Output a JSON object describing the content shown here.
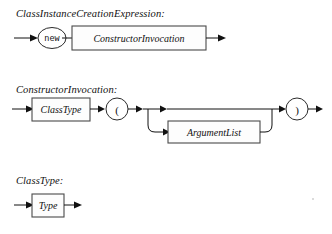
{
  "document": {
    "kind": "railroad-syntax-diagram",
    "background_color": "#ffffff",
    "ink_color": "#111111",
    "box_stroke_color": "#4a4a4a"
  },
  "productions": [
    {
      "id": "class-instance-creation-expression",
      "title": "ClassInstanceCreationExpression:",
      "nodes": [
        {
          "kind": "terminal",
          "shape": "oval",
          "label": "new"
        },
        {
          "kind": "nonterminal",
          "shape": "box",
          "label": "ConstructorInvocation"
        }
      ]
    },
    {
      "id": "constructor-invocation",
      "title": "ConstructorInvocation:",
      "nodes": [
        {
          "kind": "nonterminal",
          "shape": "box",
          "label": "ClassType"
        },
        {
          "kind": "terminal",
          "shape": "oval",
          "label": "("
        },
        {
          "kind": "optional-branch",
          "shape": "box",
          "label": "ArgumentList"
        },
        {
          "kind": "terminal",
          "shape": "oval",
          "label": ")"
        }
      ]
    },
    {
      "id": "class-type",
      "title": "ClassType:",
      "nodes": [
        {
          "kind": "nonterminal",
          "shape": "box",
          "label": "Type"
        }
      ]
    }
  ]
}
